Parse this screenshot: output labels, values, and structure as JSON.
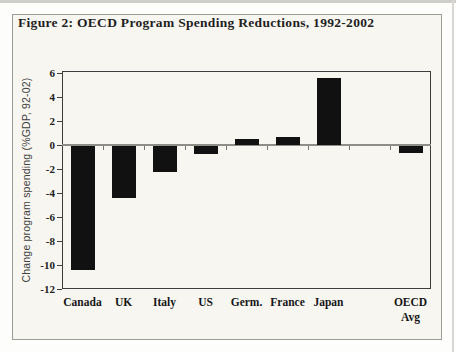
{
  "figure": {
    "title": "Figure 2: OECD Program Spending Reductions, 1992-2002"
  },
  "chart_data": {
    "type": "bar",
    "title": "Figure 2: OECD Program Spending Reductions, 1992-2002",
    "ylabel": "Change program spending (%GDP, 92-02)",
    "categories": [
      "Canada",
      "UK",
      "Italy",
      "US",
      "Germ.",
      "France",
      "Japan",
      "",
      "OECD\nAvg"
    ],
    "values": [
      -10.3,
      -4.3,
      -2.2,
      -0.7,
      0.5,
      0.7,
      5.6,
      null,
      -0.6
    ],
    "ylim": [
      -12,
      6
    ],
    "yticks": [
      6,
      4,
      2,
      0,
      -2,
      -4,
      -6,
      -8,
      -10,
      -12
    ],
    "grid": false,
    "bar_color": "#111111",
    "axis_color": "#3d3d3d",
    "zero_line_color": "#8e8e88",
    "note": ""
  }
}
